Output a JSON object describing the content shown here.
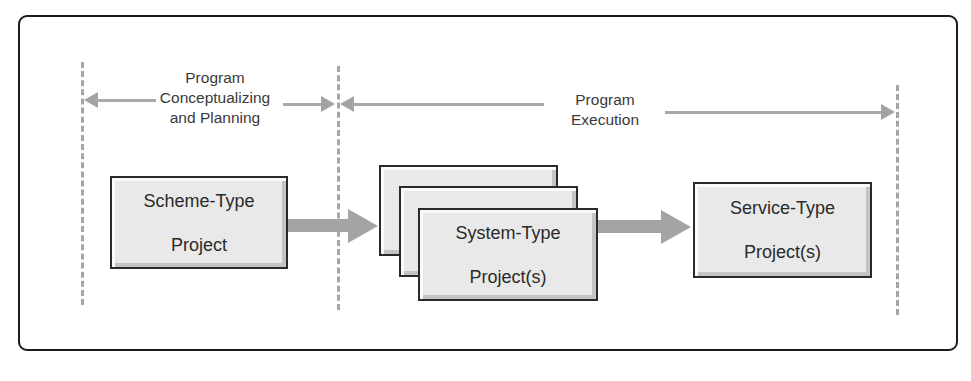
{
  "diagram": {
    "type": "process-flow",
    "phases": [
      {
        "id": "planning",
        "label": "Program\nConceptualizing\nand Planning",
        "lines": [
          "Program",
          "Conceptualizing",
          "and Planning"
        ]
      },
      {
        "id": "execution",
        "label": "Program\nExecution",
        "lines": [
          "Program",
          "Execution"
        ]
      }
    ],
    "nodes": [
      {
        "id": "scheme",
        "label": "Scheme-Type\nProject",
        "lines": [
          "Scheme-Type",
          "Project"
        ],
        "phase": "planning",
        "stacked": false
      },
      {
        "id": "system",
        "label": "System-Type\nProject(s)",
        "lines": [
          "System-Type",
          "Project(s)"
        ],
        "phase": "execution",
        "stacked": true,
        "stack_count": 3
      },
      {
        "id": "service",
        "label": "Service-Type\nProject(s)",
        "lines": [
          "Service-Type",
          "Project(s)"
        ],
        "phase": "execution",
        "stacked": false
      }
    ],
    "edges": [
      {
        "from": "scheme",
        "to": "system"
      },
      {
        "from": "system",
        "to": "service"
      }
    ],
    "colors": {
      "frame_border": "#1c1c1c",
      "box_fill": "#e9e9e9",
      "box_border": "#2a2a2a",
      "arrow": "#a4a4a4",
      "divider": "#a6a6a6",
      "text": "#3a3a3a"
    }
  }
}
